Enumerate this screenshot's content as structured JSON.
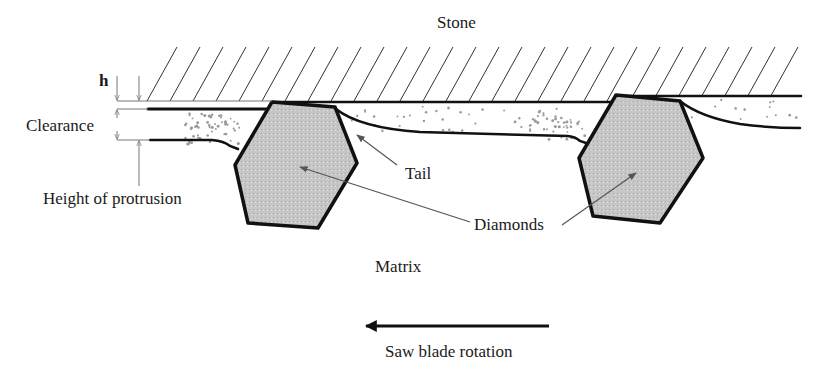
{
  "diagram": {
    "type": "cross-section schematic",
    "labels": {
      "stone": "Stone",
      "h": "h",
      "clearance": "Clearance",
      "height_of_protrusion": "Height of protrusion",
      "tail": "Tail",
      "diamonds": "Diamonds",
      "matrix": "Matrix",
      "saw_blade_rotation": "Saw blade rotation"
    },
    "colors": {
      "line": "#111111",
      "diamond_fill": "#c4c4c4",
      "hatch": "#333333",
      "dimension": "#777777",
      "debris": "#9a9a9a"
    },
    "elements": {
      "diamonds_count": 2,
      "rotation_direction": "left"
    }
  }
}
